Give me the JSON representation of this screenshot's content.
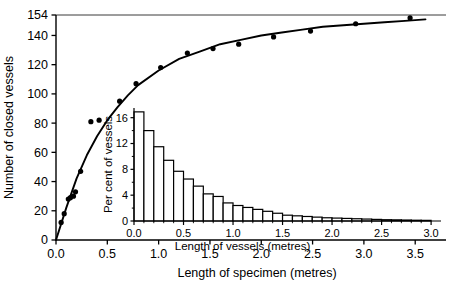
{
  "chart_data": [
    {
      "id": "main",
      "type": "scatter",
      "title": "",
      "xlabel": "Length of specimen (metres)",
      "ylabel": "Number of closed vessels",
      "xlim": [
        0.0,
        3.8
      ],
      "ylim": [
        0,
        154
      ],
      "grid": false,
      "legend": "none",
      "xticks": [
        0.0,
        0.5,
        1.0,
        1.5,
        2.0,
        2.5,
        3.0,
        3.5
      ],
      "xticklabels": [
        "0.0",
        "0.5",
        "1.0",
        "1.5",
        "2.0",
        "2.5",
        "3.0",
        "3.5"
      ],
      "yticks": [
        0,
        20,
        40,
        60,
        80,
        100,
        120,
        140,
        154
      ],
      "yticklabels": [
        "0",
        "20",
        "40",
        "60",
        "80",
        "100",
        "120",
        "140",
        "154"
      ],
      "annotations": [
        {
          "text": "asymptote at 154 closed vessels",
          "y": 154
        }
      ],
      "series": [
        {
          "name": "observed",
          "marker": "filled-circle",
          "x": [
            0.05,
            0.08,
            0.12,
            0.14,
            0.17,
            0.19,
            0.24,
            0.34,
            0.42,
            0.62,
            0.78,
            1.02,
            1.28,
            1.53,
            1.78,
            2.12,
            2.48,
            2.92,
            3.45
          ],
          "y": [
            12,
            18,
            28,
            29,
            30,
            33,
            47,
            81,
            82,
            95,
            107,
            118,
            128,
            131,
            134,
            139,
            143,
            148,
            152
          ]
        },
        {
          "name": "fitted-curve",
          "type": "line",
          "x": [
            0.0,
            0.1,
            0.2,
            0.3,
            0.4,
            0.5,
            0.6,
            0.7,
            0.8,
            1.0,
            1.2,
            1.4,
            1.6,
            1.8,
            2.0,
            2.2,
            2.4,
            2.6,
            2.8,
            3.0,
            3.2,
            3.4,
            3.6
          ],
          "y": [
            0,
            22,
            42,
            58,
            71,
            82,
            91,
            99,
            106,
            116,
            124,
            129,
            134,
            137,
            140,
            142,
            144,
            146,
            147,
            148,
            149,
            150,
            151
          ]
        },
        {
          "name": "asymptote",
          "type": "line",
          "x": [
            0.0,
            3.8
          ],
          "y": [
            154,
            154
          ]
        }
      ]
    },
    {
      "id": "inset",
      "type": "bar",
      "title": "",
      "xlabel": "Length of vessels (metres)",
      "ylabel": "Per cent of vessels",
      "xlim": [
        0.0,
        3.1
      ],
      "ylim": [
        0,
        17.5
      ],
      "grid": false,
      "legend": "none",
      "xticks": [
        0.0,
        0.5,
        1.0,
        1.5,
        2.0,
        2.5,
        3.0
      ],
      "xticklabels": [
        "0.0",
        "0.5",
        "1.0",
        "1.5",
        "2.0",
        "2.5",
        "3.0"
      ],
      "yticks": [
        0,
        4,
        8,
        12,
        16
      ],
      "yticklabels": [
        "0",
        "4",
        "8",
        "12",
        "16"
      ],
      "bin_width": 0.1,
      "categories": [
        "0.0-0.1",
        "0.1-0.2",
        "0.2-0.3",
        "0.3-0.4",
        "0.4-0.5",
        "0.5-0.6",
        "0.6-0.7",
        "0.7-0.8",
        "0.8-0.9",
        "0.9-1.0",
        "1.0-1.1",
        "1.1-1.2",
        "1.2-1.3",
        "1.3-1.4",
        "1.4-1.5",
        "1.5-1.6",
        "1.6-1.7",
        "1.7-1.8",
        "1.8-1.9",
        "1.9-2.0",
        "2.0-2.1",
        "2.1-2.2",
        "2.2-2.3",
        "2.3-2.4",
        "2.4-2.5",
        "2.5-2.6",
        "2.6-2.7",
        "2.7-2.8",
        "2.8-2.9",
        "2.9-3.0"
      ],
      "values": [
        16.9,
        14.0,
        11.5,
        9.4,
        7.7,
        6.5,
        5.4,
        4.2,
        3.8,
        2.8,
        2.4,
        2.1,
        1.8,
        1.5,
        1.2,
        0.9,
        0.8,
        0.7,
        0.6,
        0.5,
        0.45,
        0.4,
        0.35,
        0.3,
        0.25,
        0.2,
        0.18,
        0.15,
        0.12,
        0.1
      ]
    }
  ]
}
